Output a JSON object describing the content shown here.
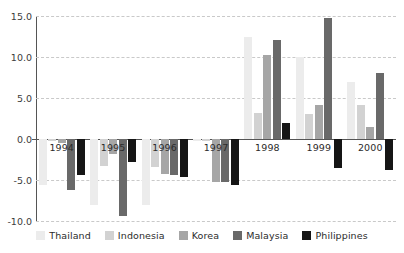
{
  "chart_data": {
    "type": "bar",
    "title": "",
    "subtitle": "",
    "xlabel": "",
    "ylabel": "",
    "ylim": [
      -10.0,
      15.0
    ],
    "yticks": [
      15.0,
      10.0,
      5.0,
      0.0,
      -5.0,
      -10.0
    ],
    "ytick_labels": [
      "15.0",
      "10.0",
      "5.0",
      "0.0",
      "-5.0",
      "-10.0"
    ],
    "grid": true,
    "legend_position": "bottom",
    "categories": [
      "1994",
      "1995",
      "1996",
      "1997",
      "1998",
      "1999",
      "2000"
    ],
    "series": [
      {
        "name": "Thailand",
        "color": "#ececec",
        "values": [
          -5.6,
          -8.0,
          -8.0,
          -0.3,
          12.4,
          10.0,
          7.0
        ]
      },
      {
        "name": "Indonesia",
        "color": "#d2d2d2",
        "values": [
          -0.3,
          -3.3,
          -3.4,
          -0.2,
          3.2,
          3.0,
          4.2
        ]
      },
      {
        "name": "Korea",
        "color": "#a6a6a6",
        "values": [
          -0.5,
          -1.8,
          -4.3,
          -5.2,
          10.3,
          4.2,
          1.5
        ]
      },
      {
        "name": "Malaysia",
        "color": "#696969",
        "values": [
          -6.2,
          -9.4,
          -4.4,
          -5.3,
          12.1,
          14.7,
          8.0
        ]
      },
      {
        "name": "Philippines",
        "color": "#151515",
        "values": [
          -4.4,
          -2.8,
          -4.6,
          -5.6,
          1.9,
          -3.5,
          -3.8
        ]
      }
    ]
  }
}
